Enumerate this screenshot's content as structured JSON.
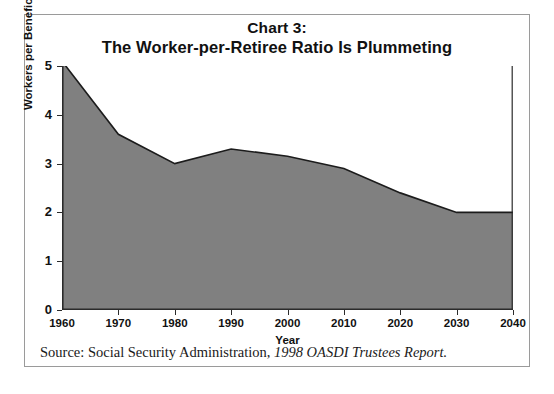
{
  "chart_data": {
    "type": "area",
    "title": "Chart 3:",
    "subtitle": "The Worker-per-Retiree Ratio Is Plummeting",
    "xlabel": "Year",
    "ylabel": "Workers per Beneficiary",
    "x": [
      1960,
      1970,
      1980,
      1990,
      2000,
      2010,
      2020,
      2030,
      2040
    ],
    "values": [
      5.1,
      3.6,
      3.0,
      3.3,
      3.15,
      2.9,
      2.4,
      2.0,
      2.0
    ],
    "categories": [
      "1960",
      "1970",
      "1980",
      "1990",
      "2000",
      "2010",
      "2020",
      "2030",
      "2040"
    ],
    "xtick_labels": [
      "1960",
      "1970",
      "1980",
      "1990",
      "2000",
      "2010",
      "2020",
      "2030",
      "2040"
    ],
    "ytick_labels": [
      "0",
      "1",
      "2",
      "3",
      "4",
      "5"
    ],
    "ytick_values": [
      0,
      1,
      2,
      3,
      4,
      5
    ],
    "xlim": [
      1960,
      2040
    ],
    "ylim": [
      0,
      5
    ],
    "grid": false,
    "legend": false,
    "series_name": "Workers per Beneficiary",
    "fill_color": "#808080",
    "line_color": "#1c1c1c",
    "axis_color": "#2b2b2b"
  },
  "source": {
    "prefix": "Source: Social Security Administration, ",
    "report": "1998 OASDI Trustees Report."
  },
  "frame": {
    "border_color": "#9a9a9a"
  }
}
